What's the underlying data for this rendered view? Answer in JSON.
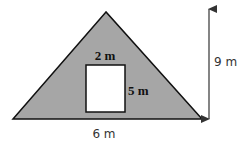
{
  "diagram": {
    "shape": "triangle-with-rectangular-cutout",
    "triangle": {
      "base_label": "6 m",
      "height_label": "9 m",
      "fill_color": "#a6a6a6",
      "stroke_color": "#111111"
    },
    "cutout": {
      "width_label": "2 m",
      "height_label": "5 m",
      "fill_color": "#ffffff"
    },
    "height_arrow": {
      "icon": "double-headed-vertical-arrow",
      "color": "#333333"
    }
  }
}
